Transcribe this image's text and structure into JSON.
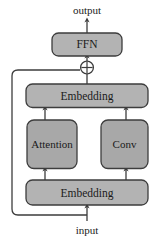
{
  "diagram": {
    "io": {
      "output_label": "output",
      "input_label": "input"
    },
    "nodes": [
      {
        "id": "ffn",
        "label": "FFN",
        "shape": "rounded-rect",
        "fill": "#b3b3b3"
      },
      {
        "id": "emb_top",
        "label": "Embedding",
        "shape": "rounded-rect",
        "fill": "#b3b3b3"
      },
      {
        "id": "attention",
        "label": "Attention",
        "shape": "rounded-rect",
        "fill": "#a8a8a8"
      },
      {
        "id": "conv",
        "label": "Conv",
        "shape": "rounded-rect",
        "fill": "#a8a8a8"
      },
      {
        "id": "emb_bottom",
        "label": "Embedding",
        "shape": "rounded-rect",
        "fill": "#b3b3b3"
      }
    ],
    "operators": [
      {
        "id": "add",
        "symbol": "+",
        "shape": "circle-plus",
        "name": "residual-add"
      }
    ],
    "edges": [
      {
        "from": "ffn",
        "to": "output",
        "arrow": true
      },
      {
        "from": "add",
        "to": "ffn",
        "arrow": true
      },
      {
        "from": "emb_top",
        "to": "add",
        "arrow": true
      },
      {
        "from": "attention",
        "to": "emb_top",
        "arrow": true
      },
      {
        "from": "conv",
        "to": "emb_top",
        "arrow": true
      },
      {
        "from": "emb_bottom",
        "to": "attention",
        "arrow": true
      },
      {
        "from": "emb_bottom",
        "to": "conv",
        "arrow": true
      },
      {
        "from": "input",
        "to": "emb_bottom",
        "arrow": true
      },
      {
        "from": "input",
        "to": "add",
        "arrow": false,
        "style": "skip-connection"
      }
    ],
    "colors": {
      "stroke": "#3d3d3d",
      "box_fill": "#b3b3b3",
      "box_fill_alt": "#a8a8a8",
      "text": "#1a1a1a",
      "background": "#ffffff"
    }
  }
}
